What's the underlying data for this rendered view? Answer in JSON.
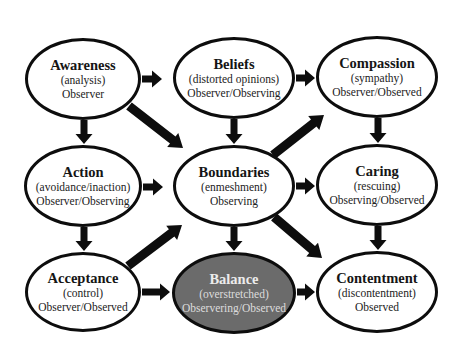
{
  "colors": {
    "outline": "#0d0d0d",
    "node_fill": "#ffffff",
    "highlight_fill": "#6b6b6b",
    "highlight_text": "#ececec",
    "arrow": "#0d0d0d"
  },
  "nodes": [
    {
      "id": "awareness",
      "title": "Awareness",
      "sub": "(analysis)",
      "role": "Observer",
      "cx": 83,
      "cy": 79,
      "rx": 58,
      "ry": 41,
      "highlight": false
    },
    {
      "id": "beliefs",
      "title": "Beliefs",
      "sub": "(distorted opinions)",
      "role": "Observer/Observing",
      "cx": 234,
      "cy": 78,
      "rx": 61,
      "ry": 41,
      "highlight": false
    },
    {
      "id": "compassion",
      "title": "Compassion",
      "sub": "(sympathy)",
      "role": "Observer/Observed",
      "cx": 377,
      "cy": 77,
      "rx": 61,
      "ry": 41,
      "highlight": false
    },
    {
      "id": "action",
      "title": "Action",
      "sub": "(avoidance/inaction)",
      "role": "Observer/Observing",
      "cx": 83,
      "cy": 186,
      "rx": 59,
      "ry": 41,
      "highlight": false
    },
    {
      "id": "boundaries",
      "title": "Boundaries",
      "sub": "(enmeshment)",
      "role": "Observing",
      "cx": 234,
      "cy": 186,
      "rx": 61,
      "ry": 41,
      "highlight": false
    },
    {
      "id": "caring",
      "title": "Caring",
      "sub": "(rescuing)",
      "role": "Observing/Observed",
      "cx": 377,
      "cy": 185,
      "rx": 61,
      "ry": 41,
      "highlight": false
    },
    {
      "id": "acceptance",
      "title": "Acceptance",
      "sub": "(control)",
      "role": "Observer/Observed",
      "cx": 83,
      "cy": 292,
      "rx": 58,
      "ry": 40,
      "highlight": false
    },
    {
      "id": "balance",
      "title": "Balance",
      "sub": "(overstretched)",
      "role": "Observering/Observed",
      "cx": 234,
      "cy": 293,
      "rx": 62,
      "ry": 41,
      "highlight": true
    },
    {
      "id": "contentment",
      "title": "Contentment",
      "sub": "(discontentment)",
      "role": "Observed",
      "cx": 377,
      "cy": 292,
      "rx": 61,
      "ry": 41,
      "highlight": false
    }
  ],
  "edges": [
    {
      "from": "awareness",
      "to": "beliefs",
      "type": "short",
      "x1": 142,
      "y1": 79,
      "x2": 162,
      "y2": 79
    },
    {
      "from": "beliefs",
      "to": "compassion",
      "type": "short",
      "x1": 296,
      "y1": 78,
      "x2": 315,
      "y2": 78
    },
    {
      "from": "awareness",
      "to": "action",
      "type": "short",
      "x1": 84,
      "y1": 120,
      "x2": 84,
      "y2": 144
    },
    {
      "from": "beliefs",
      "to": "boundaries",
      "type": "short",
      "x1": 234,
      "y1": 119,
      "x2": 234,
      "y2": 144
    },
    {
      "from": "compassion",
      "to": "caring",
      "type": "short",
      "x1": 378,
      "y1": 118,
      "x2": 378,
      "y2": 143
    },
    {
      "from": "action",
      "to": "boundaries",
      "type": "short",
      "x1": 143,
      "y1": 187,
      "x2": 163,
      "y2": 187
    },
    {
      "from": "boundaries",
      "to": "caring",
      "type": "short",
      "x1": 296,
      "y1": 186,
      "x2": 315,
      "y2": 186
    },
    {
      "from": "action",
      "to": "acceptance",
      "type": "short",
      "x1": 84,
      "y1": 227,
      "x2": 84,
      "y2": 251
    },
    {
      "from": "boundaries",
      "to": "balance",
      "type": "short",
      "x1": 234,
      "y1": 227,
      "x2": 234,
      "y2": 251
    },
    {
      "from": "caring",
      "to": "contentment",
      "type": "short",
      "x1": 378,
      "y1": 226,
      "x2": 378,
      "y2": 250
    },
    {
      "from": "acceptance",
      "to": "balance",
      "type": "short",
      "x1": 142,
      "y1": 292,
      "x2": 170,
      "y2": 292
    },
    {
      "from": "balance",
      "to": "contentment",
      "type": "short",
      "x1": 297,
      "y1": 292,
      "x2": 315,
      "y2": 292
    },
    {
      "from": "awareness",
      "to": "boundaries",
      "type": "long",
      "x1": 129,
      "y1": 106,
      "x2": 183,
      "y2": 148
    },
    {
      "from": "boundaries",
      "to": "compassion",
      "type": "long",
      "x1": 273,
      "y1": 155,
      "x2": 324,
      "y2": 115
    },
    {
      "from": "acceptance",
      "to": "boundaries",
      "type": "long",
      "x1": 128,
      "y1": 266,
      "x2": 182,
      "y2": 225
    },
    {
      "from": "boundaries",
      "to": "contentment",
      "type": "long",
      "x1": 274,
      "y1": 217,
      "x2": 322,
      "y2": 258
    }
  ]
}
